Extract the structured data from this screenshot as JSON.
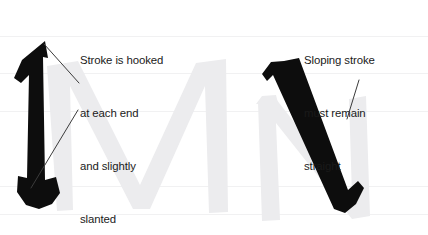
{
  "diagram": {
    "background_color": "#ffffff",
    "ink_color": "#111111",
    "watermark_color": "#ececed",
    "guide_line_color": "#f0f0f1",
    "leader_line_color": "#3b3b3b",
    "text_color": "#1a1a1a",
    "watermark_letters": [
      "M",
      "N"
    ]
  },
  "annotations": [
    {
      "id": "left-callout",
      "name": "stroke-hooked-note",
      "lines": [
        "Stroke is hooked",
        "at each end",
        "and slightly",
        "slanted"
      ],
      "leader_lines": 2
    },
    {
      "id": "right-callout",
      "name": "sloping-stroke-note",
      "lines": [
        "Sloping stroke",
        "must remain",
        "straight"
      ],
      "leader_lines": 1
    }
  ],
  "strokes": [
    {
      "id": "left-stroke",
      "name": "vertical-hooked-stem",
      "description": "Slightly slanted vertical stem with hooks at top and bottom"
    },
    {
      "id": "right-stroke",
      "name": "diagonal-sloping-stroke",
      "description": "Straight sloping diagonal stroke with serif hooks at both ends"
    }
  ]
}
